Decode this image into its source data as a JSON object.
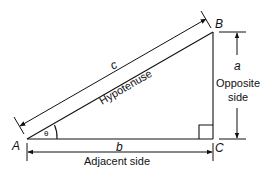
{
  "diagram": {
    "vertices": {
      "A": "A",
      "B": "B",
      "C": "C"
    },
    "sides": {
      "hypotenuse_symbol": "c",
      "hypotenuse_label": "Hypotenuse",
      "adjacent_symbol": "b",
      "adjacent_label": "Adjacent side",
      "opposite_symbol": "a",
      "opposite_label_line1": "Opposite",
      "opposite_label_line2": "side"
    },
    "angle_symbol": "θ",
    "colors": {
      "line": "#111111",
      "background": "#ffffff"
    }
  }
}
